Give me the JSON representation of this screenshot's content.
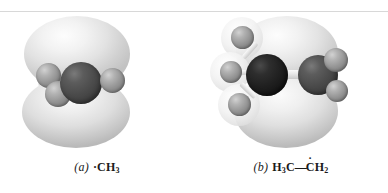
{
  "figure": {
    "background_color": "#ffffff",
    "rule_color": "#d8d8d8",
    "panels": [
      {
        "id": "a",
        "letter": "(a)",
        "caption_prefix_dot": "·",
        "formula_main": "CH",
        "formula_sub": "3",
        "formula_plain": "·CH3",
        "description": "methyl radical",
        "atoms": [
          {
            "name": "carbon-center",
            "element": "C",
            "color": "#4a4a4a",
            "size": 42
          },
          {
            "name": "hydrogen-left",
            "element": "H",
            "color": "#949494",
            "size": 25
          },
          {
            "name": "hydrogen-front",
            "element": "H",
            "color": "#949494",
            "size": 26
          },
          {
            "name": "hydrogen-right",
            "element": "H",
            "color": "#949494",
            "size": 25
          }
        ],
        "orbital": {
          "type": "p-orbital",
          "lobes": 2,
          "color": "#e6e6e6"
        }
      },
      {
        "id": "b",
        "letter": "(b)",
        "formula_left_main": "H",
        "formula_left_sub": "3",
        "formula_left_tail": "C",
        "bond_dash": "—",
        "formula_right_c": "C",
        "formula_right_h": "H",
        "formula_right_sub": "2",
        "radical_dot": "·",
        "formula_plain": "H3C—ĊH2",
        "description": "ethyl radical",
        "atoms": [
          {
            "name": "carbon-methyl",
            "element": "C",
            "color": "#1f1f1f",
            "size": 42
          },
          {
            "name": "carbon-radical",
            "element": "C",
            "color": "#4a4a4a",
            "size": 40
          },
          {
            "name": "hydrogen-methyl-top",
            "element": "H",
            "color": "#949494",
            "size": 23
          },
          {
            "name": "hydrogen-methyl-mid",
            "element": "H",
            "color": "#949494",
            "size": 22
          },
          {
            "name": "hydrogen-methyl-bottom",
            "element": "H",
            "color": "#949494",
            "size": 23
          },
          {
            "name": "hydrogen-radical-top",
            "element": "H",
            "color": "#949494",
            "size": 24
          },
          {
            "name": "hydrogen-radical-bottom",
            "element": "H",
            "color": "#949494",
            "size": 22
          }
        ],
        "orbital": {
          "type": "p-orbital",
          "lobes": 2,
          "color": "#e6e6e6"
        }
      }
    ]
  }
}
